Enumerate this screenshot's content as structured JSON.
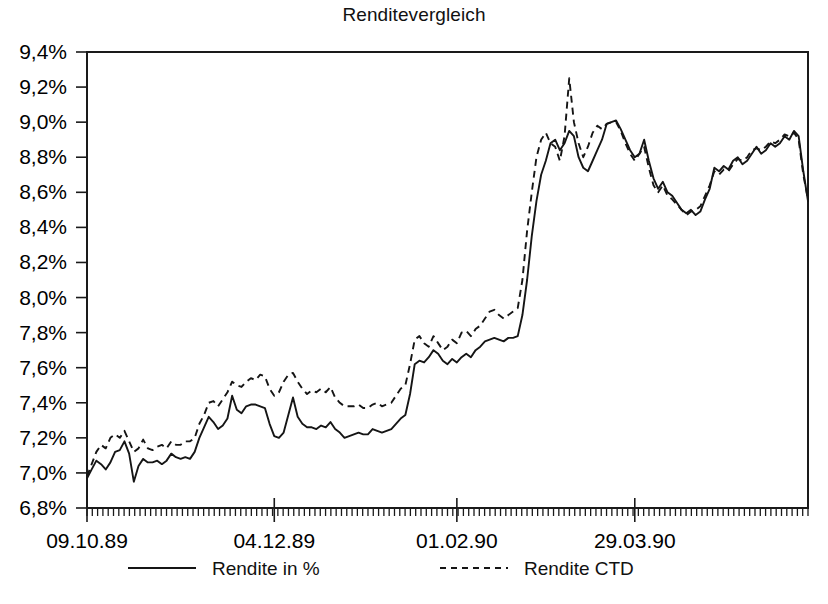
{
  "chart_data": {
    "type": "line",
    "title": "Renditevergleich",
    "xlabel": "",
    "ylabel": "",
    "grid": false,
    "legend_position": "bottom",
    "ylim": [
      6.8,
      9.4
    ],
    "ytick_labels": [
      "9,4%",
      "9,2%",
      "9,0%",
      "8,8%",
      "8,6%",
      "8,4%",
      "8,2%",
      "8,0%",
      "7,8%",
      "7,6%",
      "7,4%",
      "7,2%",
      "7,0%",
      "6,8%"
    ],
    "ytick_values": [
      9.4,
      9.2,
      9.0,
      8.8,
      8.6,
      8.4,
      8.2,
      8.0,
      7.8,
      7.6,
      7.4,
      7.2,
      7.0,
      6.8
    ],
    "xtick_labels": [
      "09.10.89",
      "04.12.89",
      "01.02.90",
      "29.03.90"
    ],
    "xtick_indices": [
      0,
      40,
      79,
      117
    ],
    "x_minor_tick_count": 136,
    "series": [
      {
        "name": "Rendite in %",
        "style": "solid",
        "values": [
          6.97,
          7.02,
          7.07,
          7.05,
          7.02,
          7.06,
          7.12,
          7.13,
          7.18,
          7.11,
          6.95,
          7.04,
          7.08,
          7.06,
          7.06,
          7.07,
          7.05,
          7.07,
          7.11,
          7.09,
          7.08,
          7.09,
          7.08,
          7.12,
          7.2,
          7.26,
          7.32,
          7.29,
          7.25,
          7.27,
          7.31,
          7.44,
          7.36,
          7.34,
          7.38,
          7.39,
          7.39,
          7.38,
          7.37,
          7.28,
          7.21,
          7.2,
          7.23,
          7.33,
          7.43,
          7.32,
          7.28,
          7.26,
          7.26,
          7.25,
          7.27,
          7.26,
          7.29,
          7.25,
          7.23,
          7.2,
          7.21,
          7.22,
          7.23,
          7.22,
          7.22,
          7.25,
          7.24,
          7.23,
          7.24,
          7.25,
          7.28,
          7.31,
          7.33,
          7.45,
          7.62,
          7.64,
          7.63,
          7.66,
          7.7,
          7.68,
          7.64,
          7.62,
          7.65,
          7.63,
          7.66,
          7.68,
          7.66,
          7.7,
          7.72,
          7.75,
          7.76,
          7.77,
          7.76,
          7.75,
          7.77,
          7.77,
          7.78,
          7.9,
          8.1,
          8.35,
          8.55,
          8.7,
          8.78,
          8.88,
          8.9,
          8.84,
          8.88,
          8.95,
          8.92,
          8.8,
          8.74,
          8.72,
          8.78,
          8.84,
          8.9,
          8.99,
          9.0,
          9.01,
          8.96,
          8.9,
          8.84,
          8.8,
          8.82,
          8.9,
          8.78,
          8.68,
          8.62,
          8.66,
          8.6,
          8.58,
          8.54,
          8.5,
          8.48,
          8.5,
          8.47,
          8.49,
          8.56,
          8.62,
          8.74,
          8.72,
          8.75,
          8.73,
          8.78,
          8.8,
          8.76,
          8.78,
          8.82,
          8.86,
          8.82,
          8.84,
          8.88,
          8.86,
          8.88,
          8.92,
          8.9,
          8.95,
          8.92,
          8.72,
          8.55
        ]
      },
      {
        "name": "Rendite CTD",
        "style": "dashed",
        "values": [
          6.98,
          7.05,
          7.12,
          7.16,
          7.14,
          7.2,
          7.22,
          7.2,
          7.24,
          7.18,
          7.12,
          7.14,
          7.19,
          7.14,
          7.13,
          7.15,
          7.16,
          7.14,
          7.18,
          7.16,
          7.16,
          7.18,
          7.18,
          7.2,
          7.28,
          7.33,
          7.4,
          7.41,
          7.38,
          7.42,
          7.46,
          7.52,
          7.5,
          7.49,
          7.52,
          7.54,
          7.53,
          7.56,
          7.55,
          7.48,
          7.44,
          7.46,
          7.52,
          7.56,
          7.57,
          7.52,
          7.48,
          7.45,
          7.47,
          7.46,
          7.48,
          7.46,
          7.49,
          7.43,
          7.4,
          7.38,
          7.38,
          7.38,
          7.39,
          7.37,
          7.37,
          7.39,
          7.4,
          7.38,
          7.39,
          7.4,
          7.44,
          7.48,
          7.5,
          7.62,
          7.76,
          7.78,
          7.74,
          7.72,
          7.78,
          7.74,
          7.7,
          7.72,
          7.76,
          7.74,
          7.8,
          7.81,
          7.78,
          7.82,
          7.84,
          7.88,
          7.92,
          7.93,
          7.9,
          7.88,
          7.9,
          7.92,
          7.94,
          8.1,
          8.38,
          8.6,
          8.8,
          8.9,
          8.94,
          8.88,
          8.86,
          8.78,
          8.92,
          9.25,
          9.0,
          8.88,
          8.8,
          8.86,
          8.94,
          8.98,
          8.96,
          8.99,
          9.0,
          9.0,
          8.95,
          8.88,
          8.82,
          8.78,
          8.82,
          8.86,
          8.74,
          8.64,
          8.6,
          8.64,
          8.58,
          8.56,
          8.53,
          8.5,
          8.47,
          8.49,
          8.5,
          8.52,
          8.58,
          8.64,
          8.72,
          8.7,
          8.73,
          8.72,
          8.76,
          8.79,
          8.78,
          8.8,
          8.84,
          8.85,
          8.84,
          8.86,
          8.89,
          8.88,
          8.9,
          8.93,
          8.92,
          8.94,
          8.9,
          8.7,
          8.56
        ]
      }
    ]
  },
  "legend": {
    "items": [
      {
        "label": "Rendite in %",
        "style": "solid"
      },
      {
        "label": "Rendite CTD",
        "style": "dashed"
      }
    ]
  }
}
